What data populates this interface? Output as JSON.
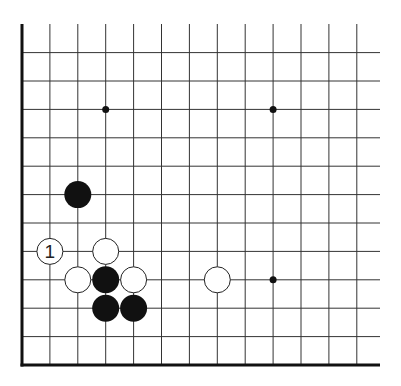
{
  "diagram": {
    "type": "go-board-corner",
    "colors": {
      "line": "#333333",
      "edge": "#111111",
      "black_stone": "#111111",
      "white_stone_fill": "#ffffff",
      "white_stone_stroke": "#222222",
      "star_point": "#111111"
    },
    "grid": {
      "columns": 13,
      "rows": 12,
      "edges": [
        "left",
        "bottom"
      ]
    },
    "star_points": [
      {
        "col": 3,
        "row": 9
      },
      {
        "col": 9,
        "row": 9
      },
      {
        "col": 9,
        "row": 3
      }
    ],
    "stones": [
      {
        "color": "black",
        "col": 2,
        "row": 6,
        "label": ""
      },
      {
        "color": "white",
        "col": 1,
        "row": 4,
        "label": "1"
      },
      {
        "color": "white",
        "col": 3,
        "row": 4,
        "label": ""
      },
      {
        "color": "white",
        "col": 2,
        "row": 3,
        "label": ""
      },
      {
        "color": "black",
        "col": 3,
        "row": 3,
        "label": ""
      },
      {
        "color": "white",
        "col": 4,
        "row": 3,
        "label": ""
      },
      {
        "color": "black",
        "col": 3,
        "row": 2,
        "label": ""
      },
      {
        "color": "black",
        "col": 4,
        "row": 2,
        "label": ""
      },
      {
        "color": "white",
        "col": 7,
        "row": 3,
        "label": ""
      }
    ]
  }
}
